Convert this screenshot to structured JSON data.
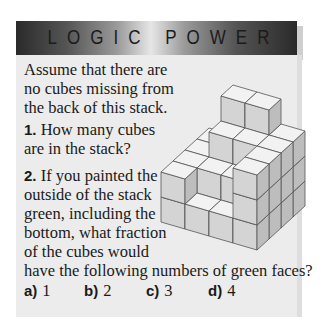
{
  "banner": {
    "title": "LOGIC POWER"
  },
  "intro": "Assume that there are no cubes missing from the back of this stack.",
  "questions": [
    {
      "number": "1.",
      "text": "How many cubes are in the stack?"
    },
    {
      "number": "2.",
      "text": "If you painted the outside of the stack green, including the bottom, what fraction of the cubes would",
      "tail": "have the following numbers of green faces?"
    }
  ],
  "options": [
    {
      "label": "a)",
      "value": "1"
    },
    {
      "label": "b)",
      "value": "2"
    },
    {
      "label": "c)",
      "value": "3"
    },
    {
      "label": "d)",
      "value": "4"
    }
  ],
  "colors": {
    "banner_dark": "#2a2a2a",
    "banner_light": "#e6e6e6",
    "box_bg": "#ececec",
    "cube_top": "#f2f2f2",
    "cube_front": "#d4d4d4",
    "cube_side": "#bdbdbd",
    "cube_edge": "#555555"
  }
}
